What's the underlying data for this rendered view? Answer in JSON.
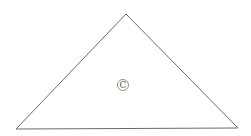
{
  "diagram": {
    "type": "triangle",
    "stroke_color": "#6b6b6b",
    "background": "#ffffff",
    "vertices": {
      "apex": [
        126,
        14
      ],
      "bottom_left": [
        16,
        129
      ],
      "bottom_right": [
        238,
        128
      ]
    },
    "center_label": {
      "text": "C",
      "circled": true,
      "position": [
        123,
        85
      ]
    }
  }
}
